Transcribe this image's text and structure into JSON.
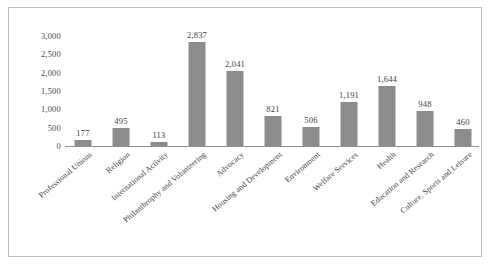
{
  "chart_data": {
    "type": "bar",
    "title": "",
    "xlabel": "",
    "ylabel": "",
    "ylim": [
      0,
      3000
    ],
    "grid": false,
    "legend": "none",
    "orientation": "vertical",
    "bar_color": "#8c8c8c",
    "categories": [
      "Professional Unions",
      "Religion",
      "International Activity",
      "Philanthrophy and Volunteering",
      "Advocacy",
      "Housing and Development",
      "Environment",
      "Welfare Services",
      "Health",
      "Education and Research",
      "Culture, Sports and Leisure"
    ],
    "values": [
      177,
      495,
      113,
      2837,
      2041,
      821,
      506,
      1191,
      1644,
      948,
      460
    ],
    "value_labels": [
      "177",
      "495",
      "113",
      "2,837",
      "2,041",
      "821",
      "506",
      "1,191",
      "1,644",
      "948",
      "460"
    ],
    "yticks": [
      0,
      500,
      1000,
      1500,
      2000,
      2500,
      3000
    ],
    "ytick_labels": [
      "0",
      "500",
      "1,000",
      "1,500",
      "2,000",
      "2,500",
      "3,000"
    ]
  },
  "style": {
    "background": "#ffffff",
    "frame_border": "#b9b9b9",
    "axis_color": "#8f8f8f",
    "text_color": "#3f3f3f"
  }
}
